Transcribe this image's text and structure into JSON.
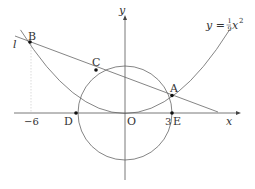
{
  "diagram": {
    "type": "coordinate-geometry",
    "axes": {
      "x_label": "x",
      "y_label": "y",
      "origin_label": "O",
      "tick_labels": {
        "neg_six": "−6",
        "three": "3"
      }
    },
    "curve": {
      "label_lhs": "y =",
      "frac_num": "1",
      "frac_den": "9",
      "var": "x",
      "exp": "2",
      "equation_text": "y = (1/9)x²"
    },
    "line": {
      "label": "l"
    },
    "circle": {
      "center": "O",
      "radius": 3
    },
    "points": {
      "A": {
        "label": "A",
        "x": 3,
        "y": 1
      },
      "B": {
        "label": "B",
        "x": -6,
        "y": 4
      },
      "C": {
        "label": "C"
      },
      "D": {
        "label": "D",
        "x": -3,
        "y": 0
      },
      "E": {
        "label": "E",
        "x": 3,
        "y": 0
      }
    },
    "colors": {
      "stroke": "#555555",
      "text": "#333333",
      "dashed": "#cccccc",
      "point": "#111111"
    }
  }
}
